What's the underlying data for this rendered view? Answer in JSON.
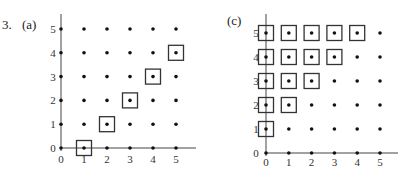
{
  "problem_label": "3.",
  "chart_data": [
    {
      "type": "scatter",
      "title": "(a)",
      "xlabel": "",
      "ylabel": "",
      "x_ticks": [
        "0",
        "1",
        "2",
        "3",
        "4",
        "5"
      ],
      "y_ticks": [
        "0",
        "1",
        "2",
        "3",
        "4",
        "5"
      ],
      "xlim": [
        0,
        5
      ],
      "ylim": [
        0,
        5
      ],
      "grid_points": "all integer lattice points (x,y) with 0<=x<=5, 0<=y<=5 shown as dots",
      "boxed_points": [
        [
          1,
          0
        ],
        [
          2,
          1
        ],
        [
          3,
          2
        ],
        [
          4,
          3
        ],
        [
          5,
          4
        ]
      ],
      "relation": "y = x - 1"
    },
    {
      "type": "scatter",
      "title": "(c)",
      "xlabel": "",
      "ylabel": "",
      "x_ticks": [
        "0",
        "1",
        "2",
        "3",
        "4",
        "5"
      ],
      "y_ticks": [
        "0",
        "1",
        "2",
        "3",
        "4",
        "5"
      ],
      "xlim": [
        0,
        5
      ],
      "ylim": [
        0,
        5
      ],
      "grid_points": "all integer lattice points (x,y) with 0<=x<=5, 0<=y<=5 shown as dots",
      "boxed_points": [
        [
          0,
          1
        ],
        [
          0,
          2
        ],
        [
          0,
          3
        ],
        [
          0,
          4
        ],
        [
          0,
          5
        ],
        [
          1,
          2
        ],
        [
          1,
          3
        ],
        [
          1,
          4
        ],
        [
          1,
          5
        ],
        [
          2,
          3
        ],
        [
          2,
          4
        ],
        [
          2,
          5
        ],
        [
          3,
          4
        ],
        [
          3,
          5
        ],
        [
          4,
          5
        ]
      ],
      "relation": "x < y"
    }
  ]
}
